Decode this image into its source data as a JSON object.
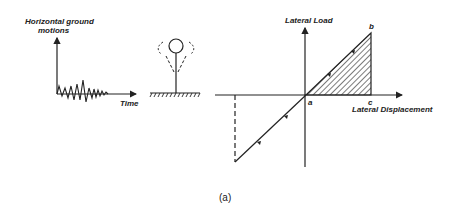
{
  "figure": {
    "caption": "(a)",
    "ground_motion_panel": {
      "ylabel_line1": "Horizontal ground",
      "ylabel_line2": "motions",
      "xlabel": "Time"
    },
    "structure_panel": {
      "description": "inverted pendulum mass on column over hatched ground, dashed swaying positions"
    },
    "load_displacement_panel": {
      "ylabel": "Lateral Load",
      "xlabel": "Lateral Displacement",
      "point_a": "a",
      "point_b": "b",
      "point_c": "c"
    }
  },
  "colors": {
    "ink": "#222222",
    "background": "#ffffff"
  }
}
